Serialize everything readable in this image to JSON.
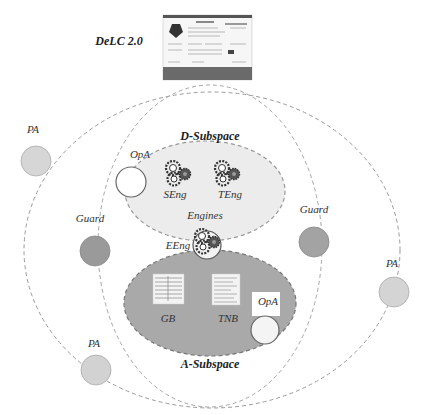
{
  "diagram": {
    "portal": {
      "label": "DeLC 2.0",
      "icon": "website-screenshot-icon"
    },
    "d_subspace": {
      "label": "D-Subspace",
      "fill": "#ececec",
      "engines_label": "Engines",
      "engines": [
        {
          "label": "SEng",
          "icon": "gears-icon"
        },
        {
          "label": "TEng",
          "icon": "gears-icon"
        }
      ]
    },
    "a_subspace": {
      "label": "A-Subspace",
      "fill": "#a9a9a9",
      "documents": [
        {
          "label": "GB",
          "icon": "document-icon"
        },
        {
          "label": "TNB",
          "icon": "document-icon"
        }
      ]
    },
    "bridge_engine": {
      "label": "EEng",
      "icon": "gears-icon"
    },
    "agents": {
      "opa_top": {
        "label": "OpA",
        "fill": "#ffffff"
      },
      "opa_bottom": {
        "label": "OpA",
        "fill": "#f4f4f4"
      },
      "guard_left": {
        "label": "Guard",
        "fill": "#9a9a9a"
      },
      "guard_right": {
        "label": "Guard",
        "fill": "#a3a3a3"
      },
      "pa_top_left": {
        "label": "PA",
        "fill": "#d6d6d6"
      },
      "pa_bottom_left": {
        "label": "PA",
        "fill": "#d2d2d2"
      },
      "pa_right": {
        "label": "PA",
        "fill": "#d4d4d4"
      }
    },
    "colors": {
      "dash_stroke": "#9a9a9a",
      "label_text": "#333333"
    }
  }
}
